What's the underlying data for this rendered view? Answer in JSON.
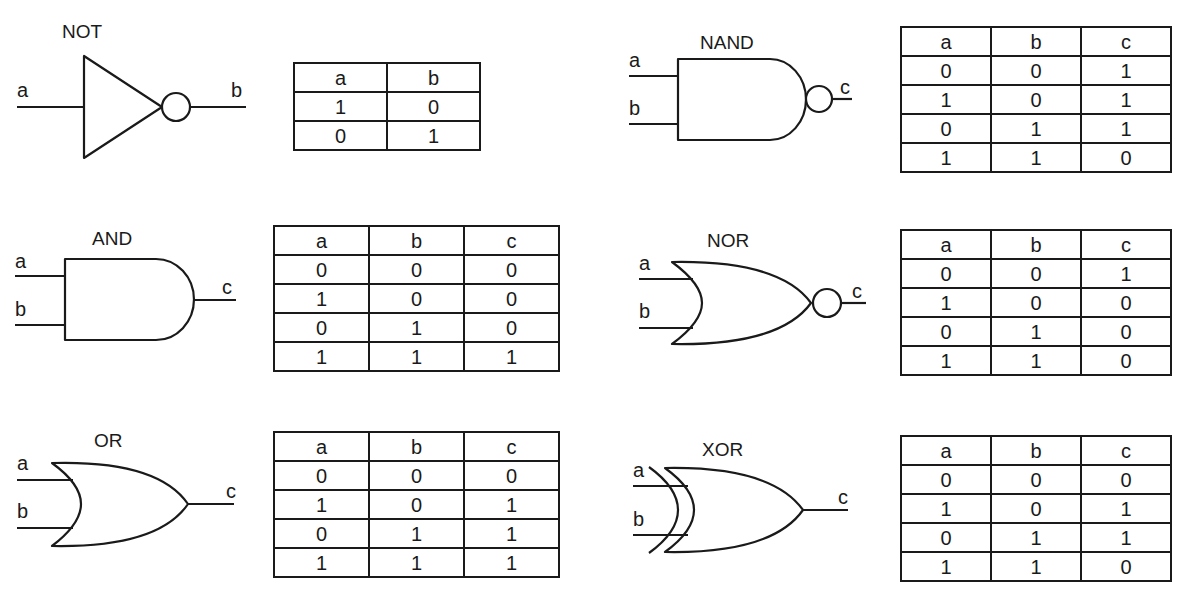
{
  "gates": {
    "not": {
      "title": "NOT",
      "inputs": [
        "a"
      ],
      "output": "b",
      "table": {
        "headers": [
          "a",
          "b"
        ],
        "rows": [
          [
            "1",
            "0"
          ],
          [
            "0",
            "1"
          ]
        ]
      }
    },
    "nand": {
      "title": "NAND",
      "inputs": [
        "a",
        "b"
      ],
      "output": "c",
      "table": {
        "headers": [
          "a",
          "b",
          "c"
        ],
        "rows": [
          [
            "0",
            "0",
            "1"
          ],
          [
            "1",
            "0",
            "1"
          ],
          [
            "0",
            "1",
            "1"
          ],
          [
            "1",
            "1",
            "0"
          ]
        ]
      }
    },
    "and": {
      "title": "AND",
      "inputs": [
        "a",
        "b"
      ],
      "output": "c",
      "table": {
        "headers": [
          "a",
          "b",
          "c"
        ],
        "rows": [
          [
            "0",
            "0",
            "0"
          ],
          [
            "1",
            "0",
            "0"
          ],
          [
            "0",
            "1",
            "0"
          ],
          [
            "1",
            "1",
            "1"
          ]
        ]
      }
    },
    "nor": {
      "title": "NOR",
      "inputs": [
        "a",
        "b"
      ],
      "output": "c",
      "table": {
        "headers": [
          "a",
          "b",
          "c"
        ],
        "rows": [
          [
            "0",
            "0",
            "1"
          ],
          [
            "1",
            "0",
            "0"
          ],
          [
            "0",
            "1",
            "0"
          ],
          [
            "1",
            "1",
            "0"
          ]
        ]
      }
    },
    "or": {
      "title": "OR",
      "inputs": [
        "a",
        "b"
      ],
      "output": "c",
      "table": {
        "headers": [
          "a",
          "b",
          "c"
        ],
        "rows": [
          [
            "0",
            "0",
            "0"
          ],
          [
            "1",
            "0",
            "1"
          ],
          [
            "0",
            "1",
            "1"
          ],
          [
            "1",
            "1",
            "1"
          ]
        ]
      }
    },
    "xor": {
      "title": "XOR",
      "inputs": [
        "a",
        "b"
      ],
      "output": "c",
      "table": {
        "headers": [
          "a",
          "b",
          "c"
        ],
        "rows": [
          [
            "0",
            "0",
            "0"
          ],
          [
            "1",
            "0",
            "1"
          ],
          [
            "0",
            "1",
            "1"
          ],
          [
            "1",
            "1",
            "0"
          ]
        ]
      }
    }
  },
  "colors": {
    "ink": "#1a1a1a",
    "paper": "#ffffff"
  }
}
